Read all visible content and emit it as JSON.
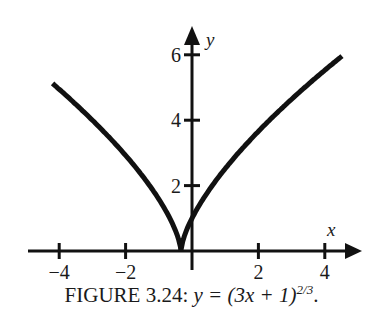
{
  "chart_data": {
    "type": "line",
    "xlabel": "x",
    "ylabel": "y",
    "xlim": [
      -4.5,
      4.7
    ],
    "ylim": [
      0,
      6.6
    ],
    "x_ticks": [
      -4,
      -2,
      2,
      4
    ],
    "x_tick_labels": [
      "−4",
      "−2",
      "2",
      "4"
    ],
    "y_ticks": [
      2,
      4,
      6
    ],
    "y_tick_labels": [
      "2",
      "4",
      "6"
    ],
    "grid": false,
    "legend": null,
    "series": [
      {
        "name": "y = (3x+1)^(2/3)",
        "function": "(3x+1)^(2/3)",
        "x": [
          -4.2,
          -4,
          -3,
          -2,
          -1,
          -0.5,
          -0.3333,
          0,
          0.5,
          1,
          2,
          3,
          4,
          4.5
        ],
        "y": [
          5.25,
          5.07,
          4.0,
          2.92,
          1.59,
          0.63,
          0.0,
          1.0,
          1.84,
          2.52,
          3.66,
          4.64,
          5.53,
          5.94
        ]
      }
    ],
    "annotations": [
      "cusp at x = -1/3, y = 0"
    ]
  },
  "caption": {
    "prefix": "FIGURE 3.24: ",
    "math": "y = (3x + 1)",
    "exponent": "2/3",
    "suffix": "."
  },
  "axes": {
    "x_name": "x",
    "y_name": "y"
  }
}
